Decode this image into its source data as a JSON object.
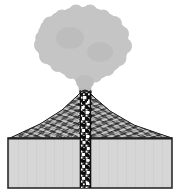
{
  "figure": {
    "width": 181,
    "height": 195,
    "background_color": "#ffffff"
  },
  "diagram": {
    "type": "geological-cross-section",
    "parts": [
      {
        "id": "ash-cloud",
        "label": "Eruption ash cloud",
        "color": "#c5c5c5",
        "outline_color": "#b4b4b4",
        "description": "Large billowing lobed plume above the summit"
      },
      {
        "id": "eruption-column",
        "label": "Eruption column",
        "color": "#b9b9b9",
        "description": "Narrow gray column rising from the crater into the cloud"
      },
      {
        "id": "volcano-cone",
        "label": "Layered volcanic cone",
        "color": "#3a3a3a",
        "fill_pattern": "alternating-strata-hatching",
        "description": "Broad cone with fine alternating dark and light radiating layers"
      },
      {
        "id": "crater",
        "label": "Summit crater",
        "description": "V-shaped notch between two summit peaks"
      },
      {
        "id": "conduit",
        "label": "Volcanic conduit / magma pipe",
        "color": "#1a1a1a",
        "fill_pattern": "black-with-white-speckle-blocks",
        "description": "Vertical dark pipe with white and black blocky clasts running from crater down through the bedrock"
      },
      {
        "id": "bedrock",
        "label": "Country rock / substrate",
        "color": "#d6d6d6",
        "outline_color": "#2b2b2b",
        "description": "Light gray rectangular block beneath the volcano with dark outline"
      },
      {
        "id": "ground-surface",
        "label": "Ground surface line",
        "color": "#2b2b2b",
        "description": "Horizontal line where cone base meets bedrock"
      }
    ],
    "colors": {
      "cloud": "#c5c5c5",
      "column": "#b9b9b9",
      "cone_dark": "#2e2e2e",
      "cone_light": "#d8d8d8",
      "conduit_dark": "#151515",
      "conduit_clast": "#ffffff",
      "bedrock_fill": "#d6d6d6",
      "outline": "#2b2b2b",
      "background": "#ffffff"
    },
    "geometry": {
      "bedrock_box": {
        "x": 8,
        "y": 138,
        "width": 164,
        "height": 50
      },
      "conduit": {
        "x": 80,
        "y": 92,
        "width": 11,
        "height": 96
      },
      "cone_base": {
        "left_x": 10,
        "right_x": 172,
        "base_y": 138
      },
      "summit": {
        "x": 85,
        "y": 90
      },
      "cloud_bounds": {
        "x": 36,
        "y": 6,
        "width": 94,
        "height": 82
      }
    }
  }
}
